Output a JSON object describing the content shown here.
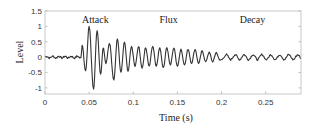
{
  "chart_data": {
    "type": "line",
    "title": "",
    "xlabel": "Time (s)",
    "ylabel": "Level",
    "xlim": [
      0,
      0.29
    ],
    "ylim": [
      -1.2,
      1.5
    ],
    "xticks": [
      0,
      0.05,
      0.1,
      0.15,
      0.2,
      0.25
    ],
    "xtick_labels": [
      "0",
      "0.05",
      "0.1",
      "0.15",
      "0.2",
      "0.25"
    ],
    "yticks": [
      1.5,
      1,
      0.5,
      0,
      -0.5,
      -1
    ],
    "ytick_labels": [
      "1.5",
      "1",
      "0.5",
      "0",
      "-0.5",
      "-1"
    ],
    "grid": false,
    "annotations": [
      {
        "text": "Attack",
        "x": 0.057,
        "y": 1.2
      },
      {
        "text": "Flux",
        "x": 0.14,
        "y": 1.2
      },
      {
        "text": "Decay",
        "x": 0.235,
        "y": 1.2
      }
    ],
    "series": [
      {
        "name": "signal",
        "color": "#333333",
        "segments": [
          {
            "x_start": 0,
            "x_end": 0.041,
            "kind": "noise",
            "amplitude": 0.06
          },
          {
            "x_start": 0.041,
            "x_end": 0.2,
            "kind": "oscillation",
            "peaks": [
              {
                "x": 0.042,
                "y": 0.4
              },
              {
                "x": 0.046,
                "y": -0.45
              },
              {
                "x": 0.05,
                "y": 1.0
              },
              {
                "x": 0.055,
                "y": -1.05
              },
              {
                "x": 0.059,
                "y": 0.85
              },
              {
                "x": 0.063,
                "y": -0.55
              },
              {
                "x": 0.066,
                "y": 0.3
              },
              {
                "x": 0.069,
                "y": -0.2
              },
              {
                "x": 0.073,
                "y": 0.45
              },
              {
                "x": 0.078,
                "y": -0.75
              },
              {
                "x": 0.082,
                "y": 0.6
              },
              {
                "x": 0.086,
                "y": -0.5
              },
              {
                "x": 0.09,
                "y": 0.5
              },
              {
                "x": 0.094,
                "y": -0.45
              },
              {
                "x": 0.098,
                "y": 0.35
              },
              {
                "x": 0.102,
                "y": -0.3
              },
              {
                "x": 0.106,
                "y": 0.35
              },
              {
                "x": 0.11,
                "y": -0.35
              },
              {
                "x": 0.114,
                "y": 0.3
              },
              {
                "x": 0.118,
                "y": -0.3
              },
              {
                "x": 0.122,
                "y": 0.35
              },
              {
                "x": 0.126,
                "y": -0.3
              },
              {
                "x": 0.13,
                "y": 0.3
              },
              {
                "x": 0.134,
                "y": -0.35
              },
              {
                "x": 0.138,
                "y": 0.3
              },
              {
                "x": 0.142,
                "y": -0.25
              },
              {
                "x": 0.146,
                "y": 0.3
              },
              {
                "x": 0.15,
                "y": -0.3
              },
              {
                "x": 0.154,
                "y": 0.25
              },
              {
                "x": 0.158,
                "y": -0.25
              },
              {
                "x": 0.162,
                "y": 0.25
              },
              {
                "x": 0.166,
                "y": -0.2
              },
              {
                "x": 0.17,
                "y": 0.25
              },
              {
                "x": 0.174,
                "y": -0.2
              },
              {
                "x": 0.178,
                "y": 0.2
              },
              {
                "x": 0.182,
                "y": -0.15
              },
              {
                "x": 0.186,
                "y": 0.15
              },
              {
                "x": 0.19,
                "y": -0.15
              },
              {
                "x": 0.194,
                "y": 0.15
              },
              {
                "x": 0.198,
                "y": -0.1
              }
            ]
          },
          {
            "x_start": 0.2,
            "x_end": 0.29,
            "kind": "decay",
            "amplitude": 0.08
          }
        ]
      }
    ]
  }
}
